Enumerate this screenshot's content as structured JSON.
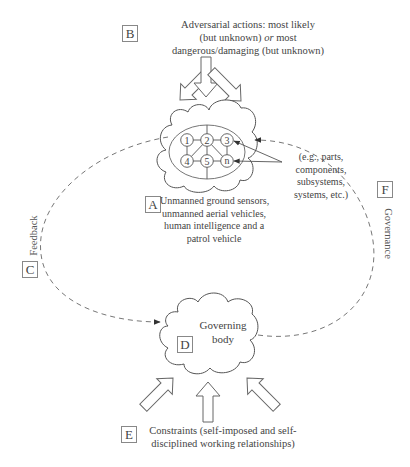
{
  "diagram": {
    "labels": {
      "A": "A",
      "B": "B",
      "C": "C",
      "D": "D",
      "E": "E",
      "F": "F"
    },
    "adversarial_text": {
      "line1": "Adversarial actions: most likely",
      "line2_pre": "(but unknown) ",
      "line2_em": "or",
      "line2_post": " most",
      "line3": "dangerous/damaging (but unknown)"
    },
    "system_nodes": [
      "1",
      "2",
      "3",
      "4",
      "5",
      "n"
    ],
    "callout_text": [
      "(e.g., parts,",
      "components,",
      "subsystems,",
      "systems, etc.)"
    ],
    "system_text": [
      "Unmanned ground sensors,",
      "unmanned aerial vehicles,",
      "human intelligence and a",
      "patrol vehicle"
    ],
    "feedback_label": "Feedback",
    "governance_label": "Governance",
    "governing_body": [
      "Governing",
      "body"
    ],
    "constraints_text": [
      "Constraints (self-imposed and self-",
      "disciplined working relationships)"
    ],
    "colors": {
      "stroke": "#555555",
      "arrow_fill": "#ffffff",
      "dash": "#777777",
      "text": "#444444"
    }
  }
}
